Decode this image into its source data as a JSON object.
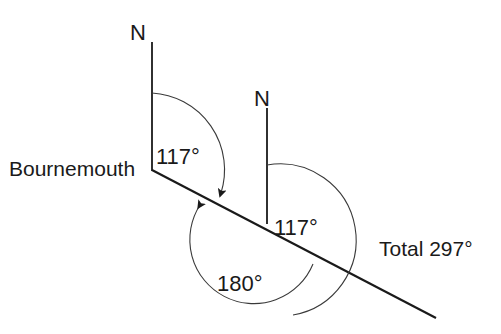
{
  "figure": {
    "type": "bearings-diagram",
    "background_color": "#ffffff",
    "line_color": "#1a1a1a",
    "arc_color": "#3a3a3a",
    "place_label": "Bournemouth",
    "north_label_1": "N",
    "north_label_2": "N",
    "angle_label_1": "117°",
    "angle_label_2": "180°",
    "angle_label_3": "117°",
    "total_label": "Total 297°",
    "angles": {
      "first_bearing_deg": 117,
      "straight_angle_deg": 180,
      "second_bearing_deg": 117,
      "total_deg": 297
    },
    "partial_top_text": ""
  }
}
